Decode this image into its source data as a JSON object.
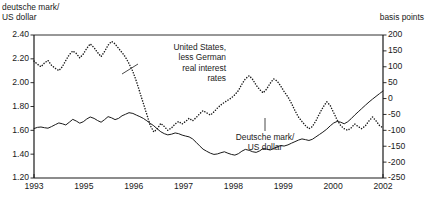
{
  "header": {
    "left_title": "deutsche mark/\nUS dollar",
    "right_title": "basis points"
  },
  "annotations": {
    "us_rates": "United States,\nless German\nreal interest\nrates",
    "dm_usd": "Deutsche mark/\nUS dollar"
  },
  "chart_data": {
    "type": "line",
    "title": "",
    "subtitle": "",
    "xlabel": "",
    "ylabel": "deutsche mark/US dollar",
    "y2label": "basis points",
    "grid": false,
    "legend": "annotations-inline",
    "xlim": [
      1993.0,
      2002.0
    ],
    "xtick_labels": [
      "1993",
      "1995",
      "1996",
      "1997",
      "1998",
      "1999",
      "2000",
      "2002"
    ],
    "xtick_values": [
      1993.0,
      1994.286,
      1995.571,
      1996.857,
      1998.143,
      1999.429,
      2000.714,
      2002.0
    ],
    "ylim": [
      1.2,
      2.4
    ],
    "ytick_labels": [
      "2.40",
      "2.20",
      "2.00",
      "1.80",
      "1.60",
      "1.40",
      "1.20"
    ],
    "ytick_values": [
      2.4,
      2.2,
      2.0,
      1.8,
      1.6,
      1.4,
      1.2
    ],
    "y2lim": [
      -250,
      200
    ],
    "y2tick_labels": [
      "200",
      "150",
      "100",
      "50",
      "0",
      "-50",
      "-100",
      "-150",
      "-200",
      "-250"
    ],
    "y2tick_values": [
      200,
      150,
      100,
      50,
      0,
      -50,
      -100,
      -150,
      -200,
      -250
    ],
    "series": [
      {
        "name": "Deutsche mark/US dollar",
        "axis": "left",
        "style": "solid",
        "color": "#1a1a1a",
        "x": [
          1993.0,
          1993.09,
          1993.18,
          1993.27,
          1993.36,
          1993.45,
          1993.55,
          1993.64,
          1993.73,
          1993.82,
          1993.91,
          1994.0,
          1994.09,
          1994.18,
          1994.27,
          1994.36,
          1994.45,
          1994.55,
          1994.64,
          1994.73,
          1994.82,
          1994.91,
          1995.0,
          1995.09,
          1995.18,
          1995.27,
          1995.36,
          1995.45,
          1995.55,
          1995.64,
          1995.73,
          1995.82,
          1995.91,
          1996.0,
          1996.09,
          1996.18,
          1996.27,
          1996.36,
          1996.45,
          1996.55,
          1996.64,
          1996.73,
          1996.82,
          1996.91,
          1997.0,
          1997.09,
          1997.18,
          1997.27,
          1997.36,
          1997.45,
          1997.55,
          1997.64,
          1997.73,
          1997.82,
          1997.91,
          1998.0,
          1998.09,
          1998.18,
          1998.27,
          1998.36,
          1998.45,
          1998.55,
          1998.64,
          1998.73,
          1998.82,
          1998.91,
          1999.0,
          1999.09,
          1999.18,
          1999.27,
          1999.36,
          1999.45,
          1999.55,
          1999.64,
          1999.73,
          1999.82,
          1999.91,
          2000.0,
          2000.09,
          2000.18,
          2000.27,
          2000.36,
          2000.45,
          2000.55,
          2000.64,
          2000.73,
          2000.82,
          2000.91,
          2001.0,
          2001.09,
          2001.18,
          2001.27,
          2001.36,
          2001.45,
          2001.55,
          2001.64,
          2001.73,
          2001.82,
          2001.91,
          2002.0
        ],
        "y": [
          1.615,
          1.625,
          1.628,
          1.622,
          1.618,
          1.631,
          1.648,
          1.662,
          1.655,
          1.645,
          1.668,
          1.692,
          1.678,
          1.66,
          1.672,
          1.695,
          1.712,
          1.7,
          1.682,
          1.668,
          1.69,
          1.715,
          1.705,
          1.69,
          1.7,
          1.722,
          1.735,
          1.748,
          1.742,
          1.728,
          1.715,
          1.7,
          1.68,
          1.658,
          1.638,
          1.612,
          1.588,
          1.572,
          1.562,
          1.568,
          1.578,
          1.572,
          1.56,
          1.552,
          1.545,
          1.528,
          1.5,
          1.47,
          1.442,
          1.425,
          1.408,
          1.398,
          1.402,
          1.412,
          1.42,
          1.408,
          1.398,
          1.392,
          1.404,
          1.425,
          1.44,
          1.432,
          1.42,
          1.415,
          1.428,
          1.448,
          1.442,
          1.435,
          1.448,
          1.462,
          1.472,
          1.468,
          1.478,
          1.492,
          1.505,
          1.518,
          1.528,
          1.522,
          1.515,
          1.525,
          1.545,
          1.565,
          1.585,
          1.61,
          1.638,
          1.662,
          1.675,
          1.668,
          1.655,
          1.672,
          1.698,
          1.728,
          1.755,
          1.782,
          1.812,
          1.838,
          1.862,
          1.885,
          1.908,
          1.93
        ]
      },
      {
        "name": "United States, less German real interest rates",
        "axis": "right",
        "style": "dotted",
        "color": "#1a1a1a",
        "x": [
          1993.0,
          1993.09,
          1993.18,
          1993.27,
          1993.36,
          1993.45,
          1993.55,
          1993.64,
          1993.73,
          1993.82,
          1993.91,
          1994.0,
          1994.09,
          1994.18,
          1994.27,
          1994.36,
          1994.45,
          1994.55,
          1994.64,
          1994.73,
          1994.82,
          1994.91,
          1995.0,
          1995.09,
          1995.18,
          1995.27,
          1995.36,
          1995.45,
          1995.55,
          1995.64,
          1995.73,
          1995.82,
          1995.91,
          1996.0,
          1996.09,
          1996.18,
          1996.27,
          1996.36,
          1996.45,
          1996.55,
          1996.64,
          1996.73,
          1996.82,
          1996.91,
          1997.0,
          1997.09,
          1997.18,
          1997.27,
          1997.36,
          1997.45,
          1997.55,
          1997.64,
          1997.73,
          1997.82,
          1997.91,
          1998.0,
          1998.09,
          1998.18,
          1998.27,
          1998.36,
          1998.45,
          1998.55,
          1998.64,
          1998.73,
          1998.82,
          1998.91,
          1999.0,
          1999.09,
          1999.18,
          1999.27,
          1999.36,
          1999.45,
          1999.55,
          1999.64,
          1999.73,
          1999.82,
          1999.91,
          2000.0,
          2000.09,
          2000.18,
          2000.27,
          2000.36,
          2000.45,
          2000.55,
          2000.64,
          2000.73,
          2000.82,
          2000.91,
          2001.0,
          2001.09,
          2001.18,
          2001.27,
          2001.36,
          2001.45,
          2001.55,
          2001.64,
          2001.73,
          2001.82,
          2001.91,
          2002.0
        ],
        "y": [
          118,
          108,
          100,
          112,
          120,
          105,
          95,
          88,
          100,
          120,
          138,
          150,
          142,
          128,
          140,
          158,
          172,
          160,
          145,
          132,
          148,
          168,
          180,
          172,
          158,
          145,
          130,
          110,
          85,
          55,
          20,
          -15,
          -50,
          -85,
          -105,
          -95,
          -78,
          -88,
          -100,
          -92,
          -80,
          -72,
          -80,
          -72,
          -62,
          -70,
          -60,
          -48,
          -38,
          -45,
          -52,
          -42,
          -30,
          -20,
          -12,
          -5,
          2,
          12,
          25,
          45,
          62,
          72,
          60,
          42,
          28,
          18,
          30,
          48,
          62,
          55,
          40,
          22,
          5,
          -15,
          -38,
          -58,
          -72,
          -85,
          -95,
          -88,
          -70,
          -48,
          -28,
          -10,
          -22,
          -45,
          -68,
          -85,
          -95,
          -100,
          -92,
          -80,
          -88,
          -95,
          -85,
          -70,
          -58,
          -70,
          -85,
          -92
        ]
      }
    ]
  },
  "plot": {
    "left": 34,
    "right": 383,
    "top": 35,
    "bottom": 178
  }
}
